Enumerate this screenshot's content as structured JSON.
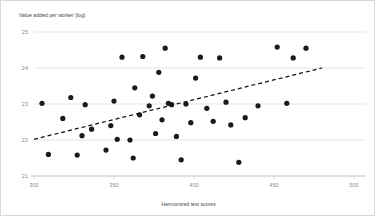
{
  "chart_data": {
    "type": "scatter",
    "title": "",
    "ylabel": "Value added per worker (log)",
    "xlabel": "Harmonized test scores",
    "xlim": [
      300,
      500
    ],
    "ylim": [
      21,
      25
    ],
    "xticks": [
      300,
      350,
      400,
      450,
      500
    ],
    "yticks": [
      21,
      22,
      23,
      24,
      25
    ],
    "xtick_labels": [
      "300",
      "350",
      "400",
      "450",
      "500"
    ],
    "ytick_labels": [
      "21",
      "22",
      "23",
      "24",
      "25"
    ],
    "grid": "horizontal",
    "legend": "none",
    "marker_color": "#1a1a1a",
    "grid_color": "#d9d9d9",
    "tick_label_color": "#8a8a8a",
    "axis_title_color": "#4a4a4a",
    "points": [
      [
        305,
        23.02
      ],
      [
        309,
        21.6
      ],
      [
        318,
        22.6
      ],
      [
        323,
        23.18
      ],
      [
        327,
        21.58
      ],
      [
        330,
        22.12
      ],
      [
        332,
        22.98
      ],
      [
        336,
        22.3
      ],
      [
        345,
        21.72
      ],
      [
        348,
        22.4
      ],
      [
        350,
        23.08
      ],
      [
        352,
        22.02
      ],
      [
        355,
        24.3
      ],
      [
        360,
        22.0
      ],
      [
        362,
        21.5
      ],
      [
        363,
        23.45
      ],
      [
        366,
        22.7
      ],
      [
        368,
        24.32
      ],
      [
        372,
        22.95
      ],
      [
        374,
        23.22
      ],
      [
        376,
        22.18
      ],
      [
        378,
        23.88
      ],
      [
        380,
        22.56
      ],
      [
        382,
        24.55
      ],
      [
        384,
        23.02
      ],
      [
        386,
        22.98
      ],
      [
        389,
        22.1
      ],
      [
        392,
        21.45
      ],
      [
        395,
        23.0
      ],
      [
        398,
        22.48
      ],
      [
        401,
        23.72
      ],
      [
        404,
        24.3
      ],
      [
        408,
        22.88
      ],
      [
        412,
        22.52
      ],
      [
        416,
        24.28
      ],
      [
        420,
        23.05
      ],
      [
        423,
        22.42
      ],
      [
        428,
        21.38
      ],
      [
        432,
        22.62
      ],
      [
        440,
        22.95
      ],
      [
        452,
        24.58
      ],
      [
        458,
        23.02
      ],
      [
        462,
        24.28
      ],
      [
        470,
        24.55
      ]
    ],
    "trend": {
      "style": "dashed",
      "x_start": 300,
      "y_start": 22.02,
      "x_end": 480,
      "y_end": 24.0
    }
  }
}
